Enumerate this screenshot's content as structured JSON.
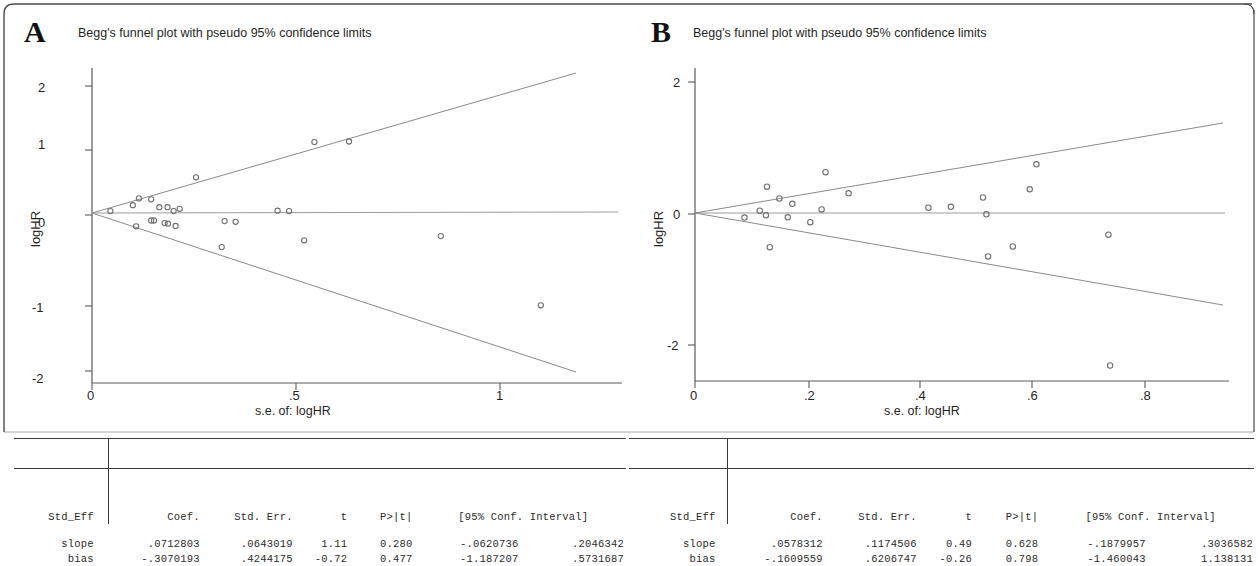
{
  "figure": {
    "panels": [
      {
        "letter": "A",
        "title": "Begg's funnel plot with pseudo 95% confidence limits",
        "ylabel": "logHR",
        "xlabel": "s.e. of: logHR"
      },
      {
        "letter": "B",
        "title": "Begg's funnel plot with pseudo 95% confidence limits",
        "ylabel": "logHR",
        "xlabel": "s.e. of: logHR"
      }
    ]
  },
  "chart_data": [
    {
      "type": "scatter",
      "panel": "A",
      "title": "Begg's funnel plot with pseudo 95% confidence limits",
      "xlabel": "s.e. of: logHR",
      "ylabel": "logHR",
      "xlim": [
        0,
        1.13
      ],
      "ylim": [
        -2.25,
        2.3
      ],
      "xticks": [
        0,
        0.5,
        1
      ],
      "xticklabels": [
        "0",
        ".5",
        "1"
      ],
      "yticks": [
        -2,
        -1,
        0,
        1,
        2
      ],
      "yticklabels": [
        "-2",
        "-1",
        "0",
        "1",
        "2"
      ],
      "grid": false,
      "legend": null,
      "center_line_y": 0.03,
      "pseudo_ci_slope": 1.96,
      "points": [
        {
          "x": 0.045,
          "y": 0.03
        },
        {
          "x": 0.1,
          "y": 0.12
        },
        {
          "x": 0.115,
          "y": 0.225
        },
        {
          "x": 0.145,
          "y": 0.21
        },
        {
          "x": 0.165,
          "y": 0.09
        },
        {
          "x": 0.185,
          "y": 0.09
        },
        {
          "x": 0.2,
          "y": 0.03
        },
        {
          "x": 0.215,
          "y": 0.065
        },
        {
          "x": 0.255,
          "y": 0.55
        },
        {
          "x": 0.108,
          "y": -0.205
        },
        {
          "x": 0.145,
          "y": -0.115
        },
        {
          "x": 0.152,
          "y": -0.115
        },
        {
          "x": 0.178,
          "y": -0.155
        },
        {
          "x": 0.186,
          "y": -0.165
        },
        {
          "x": 0.205,
          "y": -0.2
        },
        {
          "x": 0.325,
          "y": -0.125
        },
        {
          "x": 0.352,
          "y": -0.135
        },
        {
          "x": 0.318,
          "y": -0.525
        },
        {
          "x": 0.455,
          "y": 0.035
        },
        {
          "x": 0.483,
          "y": 0.03
        },
        {
          "x": 0.52,
          "y": -0.42
        },
        {
          "x": 0.545,
          "y": 1.09
        },
        {
          "x": 0.63,
          "y": 1.1
        },
        {
          "x": 0.855,
          "y": -0.355
        },
        {
          "x": 1.1,
          "y": -1.42
        }
      ],
      "table": {
        "columns": [
          "Std_Eff",
          "Coef.",
          "Std. Err.",
          "t",
          "P>|t|",
          "[95% Conf. Interval]"
        ],
        "rows": [
          {
            "label": "slope",
            "coef": ".0712803",
            "std_err": ".0643019",
            "t": "1.11",
            "p": "0.280",
            "ci_low": "-.0620736",
            "ci_high": ".2046342"
          },
          {
            "label": "bias",
            "coef": "-.3070193",
            "std_err": ".4244175",
            "t": "-0.72",
            "p": "0.477",
            "ci_low": "-1.187207",
            "ci_high": ".5731687"
          }
        ]
      }
    },
    {
      "type": "scatter",
      "panel": "B",
      "title": "Begg's funnel plot with pseudo 95% confidence limits",
      "xlabel": "s.e. of: logHR",
      "ylabel": "logHR",
      "xlim": [
        0,
        0.8
      ],
      "ylim": [
        -2.75,
        2.45
      ],
      "xticks": [
        0,
        0.2,
        0.4,
        0.6,
        0.8
      ],
      "xticklabels": [
        "0",
        ".2",
        ".4",
        ".6",
        ".8"
      ],
      "yticks": [
        -2,
        0,
        2
      ],
      "yticklabels": [
        "-2",
        "0",
        "2"
      ],
      "grid": false,
      "legend": null,
      "center_line_y": 0.01,
      "pseudo_ci_slope": 1.96,
      "points": [
        {
          "x": 0.088,
          "y": -0.07
        },
        {
          "x": 0.115,
          "y": 0.035
        },
        {
          "x": 0.126,
          "y": -0.035
        },
        {
          "x": 0.128,
          "y": 0.4
        },
        {
          "x": 0.133,
          "y": -0.52
        },
        {
          "x": 0.15,
          "y": 0.22
        },
        {
          "x": 0.165,
          "y": -0.065
        },
        {
          "x": 0.173,
          "y": 0.14
        },
        {
          "x": 0.205,
          "y": -0.14
        },
        {
          "x": 0.225,
          "y": 0.055
        },
        {
          "x": 0.232,
          "y": 0.62
        },
        {
          "x": 0.273,
          "y": 0.3
        },
        {
          "x": 0.415,
          "y": 0.08
        },
        {
          "x": 0.455,
          "y": 0.095
        },
        {
          "x": 0.512,
          "y": 0.235
        },
        {
          "x": 0.518,
          "y": -0.02
        },
        {
          "x": 0.521,
          "y": -0.66
        },
        {
          "x": 0.565,
          "y": -0.51
        },
        {
          "x": 0.595,
          "y": 0.36
        },
        {
          "x": 0.607,
          "y": 0.74
        },
        {
          "x": 0.735,
          "y": -0.33
        },
        {
          "x": 0.738,
          "y": -2.32
        }
      ],
      "table": {
        "columns": [
          "Std_Eff",
          "Coef.",
          "Std. Err.",
          "t",
          "P>|t|",
          "[95% Conf. Interval]"
        ],
        "rows": [
          {
            "label": "slope",
            "coef": ".0578312",
            "std_err": ".1174506",
            "t": "0.49",
            "p": "0.628",
            "ci_low": "-.1879957",
            "ci_high": ".3036582"
          },
          {
            "label": "bias",
            "coef": "-.1609559",
            "std_err": ".6206747",
            "t": "-0.26",
            "p": "0.798",
            "ci_low": "-1.460043",
            "ci_high": "1.138131"
          }
        ]
      }
    }
  ],
  "tables": [
    {
      "id": "table-a",
      "columns": [
        "Std_Eff",
        "Coef.",
        "Std. Err.",
        "t",
        "P>|t|",
        "[95% Conf. Interval]"
      ],
      "col_header_1": "Std_Eff",
      "col_header_2": "Coef.",
      "col_header_3": "Std. Err.",
      "col_header_4": "t",
      "col_header_5": "P>|t|",
      "col_header_6": "[95% Conf. Interval]",
      "rows": [
        [
          "slope",
          ".0712803",
          ".0643019",
          "1.11",
          "0.280",
          "-.0620736",
          ".2046342"
        ],
        [
          "bias",
          "-.3070193",
          ".4244175",
          "-0.72",
          "0.477",
          "-1.187207",
          ".5731687"
        ]
      ]
    },
    {
      "id": "table-b",
      "columns": [
        "Std_Eff",
        "Coef.",
        "Std. Err.",
        "t",
        "P>|t|",
        "[95% Conf. Interval]"
      ],
      "col_header_1": "Std_Eff",
      "col_header_2": "Coef.",
      "col_header_3": "Std. Err.",
      "col_header_4": "t",
      "col_header_5": "P>|t|",
      "col_header_6": "[95% Conf. Interval]",
      "rows": [
        [
          "slope",
          ".0578312",
          ".1174506",
          "0.49",
          "0.628",
          "-.1879957",
          ".3036582"
        ],
        [
          "bias",
          "-.1609559",
          ".6206747",
          "-0.26",
          "0.798",
          "-1.460043",
          "1.138131"
        ]
      ]
    }
  ],
  "colors": {
    "marker": "#6f6f6f",
    "axis": "#5a5a5a",
    "ci_line": "#8a8a8a",
    "text": "#1f1f1f",
    "frame": "#4a4a4a"
  }
}
